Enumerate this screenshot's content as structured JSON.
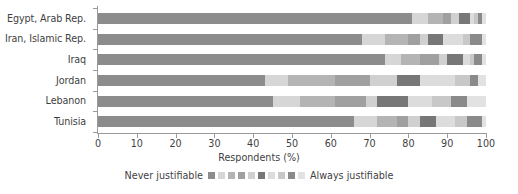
{
  "chart_data": {
    "type": "bar",
    "subtype": "horizontal-100-percent-stacked",
    "title": "",
    "xlabel": "Respondents (%)",
    "ylabel": "",
    "xlim": [
      0,
      100
    ],
    "xticks": [
      0,
      10,
      20,
      30,
      40,
      50,
      60,
      70,
      80,
      90,
      100
    ],
    "xticklabels": [
      "0",
      "10",
      "20",
      "30",
      "40",
      "50",
      "60",
      "70",
      "80",
      "90",
      "100"
    ],
    "grid": false,
    "legend_position": "bottom-center",
    "legend": {
      "left_label": "Never justifiable",
      "right_label": "Always justifiable",
      "n_categories": 10,
      "categories": [
        "1",
        "2",
        "3",
        "4",
        "5",
        "6",
        "7",
        "8",
        "9",
        "10"
      ]
    },
    "categories": [
      "Egypt, Arab Rep.",
      "Iran, Islamic Rep.",
      "Iraq",
      "Jordan",
      "Lebanon",
      "Tunisia"
    ],
    "series": [
      {
        "name": "1",
        "color": "#8c8c8c",
        "values": [
          81.0,
          68.0,
          74.0,
          43.0,
          45.0,
          66.0
        ]
      },
      {
        "name": "2",
        "color": "#d6d6d6",
        "values": [
          4.0,
          6.0,
          4.0,
          6.0,
          7.0,
          6.0
        ]
      },
      {
        "name": "3",
        "color": "#b4b4b4",
        "values": [
          4.0,
          6.0,
          5.0,
          12.0,
          9.0,
          5.0
        ]
      },
      {
        "name": "4",
        "color": "#a0a0a0",
        "values": [
          2.0,
          3.0,
          5.0,
          9.0,
          8.0,
          3.0
        ]
      },
      {
        "name": "5",
        "color": "#d0d0d0",
        "values": [
          2.0,
          2.0,
          2.0,
          7.0,
          3.0,
          3.0
        ]
      },
      {
        "name": "6",
        "color": "#777777",
        "values": [
          3.0,
          4.0,
          4.0,
          6.0,
          8.0,
          4.0
        ]
      },
      {
        "name": "7",
        "color": "#dcdcdc",
        "values": [
          1.0,
          5.0,
          2.0,
          9.0,
          6.0,
          5.0
        ]
      },
      {
        "name": "8",
        "color": "#c8c8c8",
        "values": [
          1.0,
          2.0,
          1.0,
          4.0,
          5.0,
          3.0
        ]
      },
      {
        "name": "9",
        "color": "#8a8a8a",
        "values": [
          1.0,
          3.0,
          2.0,
          2.0,
          4.0,
          4.0
        ]
      },
      {
        "name": "10",
        "color": "#e2e2e2",
        "values": [
          1.0,
          1.0,
          1.0,
          2.0,
          5.0,
          1.0
        ]
      }
    ]
  },
  "legend_swatch_colors": [
    "#8c8c8c",
    "#d6d6d6",
    "#b4b4b4",
    "#a0a0a0",
    "#d0d0d0",
    "#777777",
    "#dcdcdc",
    "#c8c8c8",
    "#8a8a8a",
    "#e2e2e2"
  ],
  "colors": {
    "axis": "#9a9a9a",
    "text": "#3f3f3f",
    "background": "#ffffff"
  }
}
